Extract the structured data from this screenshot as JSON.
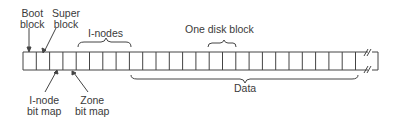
{
  "labels": {
    "boot_block_1": "Boot",
    "boot_block_2": "block",
    "super_block_1": "Super",
    "super_block_2": "block",
    "inodes": "I-nodes",
    "one_disk_block": "One disk block",
    "inode_bitmap_1": "I-node",
    "inode_bitmap_2": "bit map",
    "zone_bitmap_1": "Zone",
    "zone_bitmap_2": "bit map",
    "data": "Data"
  },
  "strip": {
    "x": 23,
    "y": 52,
    "height": 18,
    "cell_width": 13.3,
    "cells_before_break": 26,
    "regions": [
      {
        "name": "Boot block",
        "cells": 1
      },
      {
        "name": "Super block",
        "cells": 1
      },
      {
        "name": "I-node bit map",
        "cells": 1
      },
      {
        "name": "Zone bit map",
        "cells": 1
      },
      {
        "name": "I-nodes",
        "cells": 4
      },
      {
        "name": "Data",
        "cells": "remaining"
      }
    ]
  },
  "colors": {
    "line": "#444444",
    "text": "#3a3a3a",
    "background": "#ffffff"
  }
}
